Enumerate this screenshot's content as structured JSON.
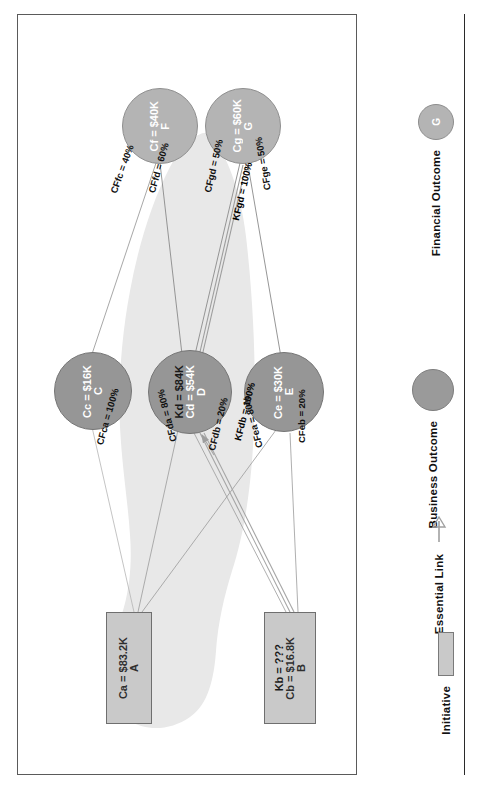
{
  "diagram": {
    "nodes": [
      {
        "id": "A",
        "type": "initiative",
        "name": "A",
        "line2": "Ca = $83.2K",
        "line3": ""
      },
      {
        "id": "B",
        "type": "initiative",
        "name": "B",
        "line2": "Cb = $16.8K",
        "line3": "Kb = ???"
      },
      {
        "id": "C",
        "type": "business-outcome",
        "name": "C",
        "line2": "Cc = $16K",
        "line3": ""
      },
      {
        "id": "D",
        "type": "business-outcome",
        "name": "D",
        "line2": "Cd = $54K",
        "line3": "Kd = $84K"
      },
      {
        "id": "E",
        "type": "business-outcome",
        "name": "E",
        "line2": "Ce = $30K",
        "line3": ""
      },
      {
        "id": "F",
        "type": "financial-outcome",
        "name": "F",
        "line2": "Cf = $40K",
        "line3": ""
      },
      {
        "id": "G",
        "type": "financial-outcome",
        "name": "G",
        "line2": "Cg = $60K",
        "line3": ""
      }
    ],
    "edges": [
      {
        "from": "C",
        "to": "A",
        "label": "CFca = 100%",
        "essential": false
      },
      {
        "from": "D",
        "to": "A",
        "label": "CFda = 80%",
        "essential": false
      },
      {
        "from": "D",
        "to": "B",
        "label": "CFdb = 20%",
        "essential": false
      },
      {
        "from": "D",
        "to": "B",
        "label": "KFdb = 100%",
        "essential": true
      },
      {
        "from": "E",
        "to": "A",
        "label": "CFea = 80%",
        "essential": false
      },
      {
        "from": "E",
        "to": "B",
        "label": "CFeb = 20%",
        "essential": false
      },
      {
        "from": "F",
        "to": "C",
        "label": "CFfc = 40%",
        "essential": false
      },
      {
        "from": "F",
        "to": "D",
        "label": "CFfd = 60%",
        "essential": false
      },
      {
        "from": "G",
        "to": "D",
        "label": "CFgd = 50%",
        "essential": false
      },
      {
        "from": "G",
        "to": "D",
        "label": "KFgd = 100%",
        "essential": true
      },
      {
        "from": "G",
        "to": "E",
        "label": "CFge = 50%",
        "essential": false
      }
    ]
  },
  "legend": {
    "items": [
      {
        "label": "Financial Outcome",
        "glyph": "circle-light",
        "glyph_text": "G"
      },
      {
        "label": "Business Outcome",
        "glyph": "circle-dark",
        "glyph_text": ""
      },
      {
        "label": "Essential Link",
        "glyph": "arrow-up",
        "glyph_text": ""
      },
      {
        "label": "Initiative",
        "glyph": "rectangle",
        "glyph_text": ""
      }
    ]
  },
  "colors": {
    "business_outcome": "#969696",
    "financial_outcome": "#b4b4b4",
    "initiative": "#c9c9c9",
    "blob": "#e6e6e6",
    "edge": "#8a8a8a",
    "essential_edge": "#9a9a9a",
    "frame": "#5a5a5a",
    "text_light": "#ffffff",
    "text_dark": "#1a1a1a"
  }
}
